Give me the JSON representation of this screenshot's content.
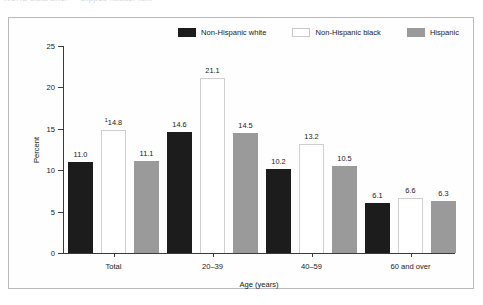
{
  "title_remnant": "NCHS Data Brief — clipped header text",
  "legend": {
    "items": [
      {
        "label": "Non-Hispanic white",
        "swatch": "black-swatch-icon",
        "color": "#1c1c1c"
      },
      {
        "label": "Non-Hispanic black",
        "swatch": "white-swatch-icon",
        "color": "#ffffff"
      },
      {
        "label": "Hispanic",
        "swatch": "gray-swatch-icon",
        "color": "#9a9a9a"
      }
    ]
  },
  "chart_data": {
    "type": "bar",
    "title": "",
    "xlabel": "Age (years)",
    "ylabel": "Percent",
    "ylim": [
      0,
      25
    ],
    "yticks": [
      0,
      5,
      10,
      15,
      20,
      25
    ],
    "ytick_labels": [
      "0",
      "5",
      "10",
      "15",
      "20",
      "25"
    ],
    "grid": false,
    "legend_position": "top-right",
    "categories": [
      "Total",
      "20–39",
      "40–59",
      "60 and over"
    ],
    "series": [
      {
        "name": "Non-Hispanic white",
        "color": "#1c1c1c",
        "values": [
          11.0,
          14.6,
          10.2,
          6.1
        ],
        "labels": [
          "11.0",
          "14.6",
          "10.2",
          "6.1"
        ],
        "label_markers": [
          "",
          "",
          "",
          ""
        ]
      },
      {
        "name": "Non-Hispanic black",
        "color": "#ffffff",
        "values": [
          14.8,
          21.1,
          13.2,
          6.6
        ],
        "labels": [
          "14.8",
          "21.1",
          "13.2",
          "6.6"
        ],
        "label_markers": [
          "1",
          "",
          "",
          ""
        ]
      },
      {
        "name": "Hispanic",
        "color": "#9a9a9a",
        "values": [
          11.1,
          14.5,
          10.5,
          6.3
        ],
        "labels": [
          "11.1",
          "14.5",
          "10.5",
          "6.3"
        ],
        "label_markers": [
          "",
          "",
          "",
          ""
        ]
      }
    ]
  }
}
